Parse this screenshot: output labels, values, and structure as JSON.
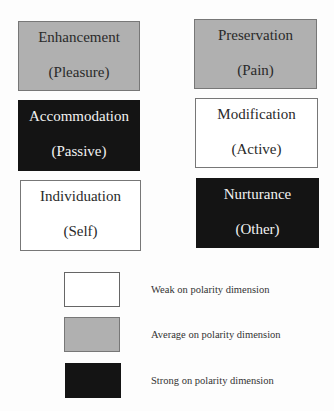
{
  "diagram": {
    "boxes": [
      {
        "id": "enhancement",
        "title": "Enhancement",
        "subtitle": "(Pleasure)",
        "level": "average",
        "fill": "#b0b0b0"
      },
      {
        "id": "preservation",
        "title": "Preservation",
        "subtitle": "(Pain)",
        "level": "average",
        "fill": "#b0b0b0"
      },
      {
        "id": "accommodation",
        "title": "Accommodation",
        "subtitle": "(Passive)",
        "level": "strong",
        "fill": "#141414"
      },
      {
        "id": "modification",
        "title": "Modification",
        "subtitle": "(Active)",
        "level": "weak",
        "fill": "#ffffff"
      },
      {
        "id": "individuation",
        "title": "Individuation",
        "subtitle": "(Self)",
        "level": "weak",
        "fill": "#ffffff"
      },
      {
        "id": "nurturance",
        "title": "Nurturance",
        "subtitle": "(Other)",
        "level": "strong",
        "fill": "#141414"
      }
    ]
  },
  "legend": {
    "items": [
      {
        "label": "Weak on polarity dimension",
        "fill": "#ffffff"
      },
      {
        "label": "Average on polarity dimension",
        "fill": "#b0b0b0"
      },
      {
        "label": "Strong on polarity dimension",
        "fill": "#141414"
      }
    ]
  }
}
